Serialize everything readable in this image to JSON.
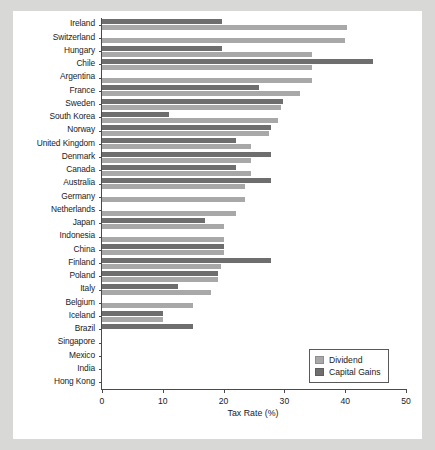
{
  "chart_data": {
    "type": "bar",
    "orientation": "horizontal",
    "title": "",
    "xlabel": "Tax Rate (%)",
    "ylabel": "",
    "xlim": [
      0,
      50
    ],
    "xticks": [
      0,
      10,
      20,
      30,
      40,
      50
    ],
    "grid": false,
    "legend": {
      "position": "bottom-right",
      "entries": [
        {
          "name": "Dividend",
          "color": "#a8a8a8"
        },
        {
          "name": "Capital Gains",
          "color": "#6e6e6e"
        }
      ]
    },
    "categories": [
      "Ireland",
      "Switzerland",
      "Hungary",
      "Chile",
      "Argentina",
      "France",
      "Sweden",
      "South Korea",
      "Norway",
      "United Kingdom",
      "Denmark",
      "Canada",
      "Australia",
      "Germany",
      "Netherlands",
      "Japan",
      "Indonesia",
      "China",
      "Finland",
      "Poland",
      "Italy",
      "Belgium",
      "Iceland",
      "Brazil",
      "Singapore",
      "Mexico",
      "India",
      "Hong Kong"
    ],
    "series": [
      {
        "name": "Dividend",
        "color": "#a8a8a8",
        "values": [
          40.3,
          40.0,
          34.5,
          34.5,
          34.5,
          32.5,
          29.5,
          29.0,
          27.5,
          24.5,
          24.5,
          24.5,
          23.5,
          23.5,
          22.0,
          20.0,
          20.0,
          20.0,
          19.5,
          19.0,
          18.0,
          15.0,
          10.0,
          0.0,
          0.0,
          0.0,
          0.0,
          0.0
        ]
      },
      {
        "name": "Capital Gains",
        "color": "#6e6e6e",
        "values": [
          19.8,
          0.0,
          19.8,
          44.5,
          0.0,
          25.8,
          29.8,
          11.0,
          27.8,
          22.0,
          27.8,
          22.0,
          27.8,
          0.0,
          0.0,
          17.0,
          0.0,
          20.0,
          27.8,
          19.0,
          12.5,
          0.0,
          10.0,
          15.0,
          0.0,
          0.0,
          0.0,
          0.0
        ]
      }
    ]
  },
  "axis": {
    "x_title": "Tax Rate (%)",
    "x_tick_labels": [
      "0",
      "10",
      "20",
      "30",
      "40",
      "50"
    ]
  }
}
